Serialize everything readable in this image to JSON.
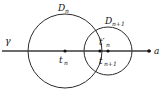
{
  "figure": {
    "type": "geometric-diagram",
    "background_color": "#ffffff",
    "stroke_color": "#2b2b2b",
    "axis_color": "#3a3a3a",
    "point_color": "#111111",
    "labels": {
      "axis_left": "γ",
      "axis_right": "a",
      "disk_big": "D",
      "disk_big_sub": "n",
      "disk_small": "D",
      "disk_small_sub": "n+1",
      "center_big": "t",
      "center_big_sub": "n",
      "center_small": "t",
      "center_small_sub": "n+1",
      "point_prime": "t′",
      "point_prime_sub": "n"
    },
    "geometry": {
      "axis_y": 51,
      "axis_x_start": 2,
      "axis_x_end": 151,
      "disk_big_cx": 65,
      "disk_big_cy": 51,
      "disk_big_r": 37,
      "disk_small_cx": 108,
      "disk_small_cy": 51,
      "disk_small_r": 24,
      "point_a_x": 149,
      "point_tn_x": 65,
      "point_tn1_x": 108,
      "point_tprime_x": 100
    }
  }
}
